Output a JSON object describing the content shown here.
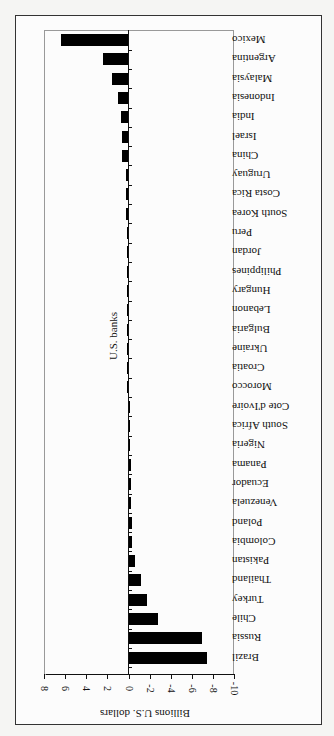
{
  "chart_data": {
    "type": "bar",
    "orientation": "horizontal, page rotated 90 degrees",
    "title": "",
    "xlabel": "Billions U.S. dollars",
    "ylabel": "",
    "series_label": "U.S. banks",
    "xlim": [
      -10,
      8
    ],
    "x_ticks": [
      "8",
      "6",
      "4",
      "2",
      "0",
      "-2",
      "-4",
      "-6",
      "-8",
      "-10"
    ],
    "grid": false,
    "categories": [
      "Mexico",
      "Argentina",
      "Malaysia",
      "Indonesia",
      "India",
      "Israel",
      "China",
      "Uruguay",
      "Costa Rica",
      "South Korea",
      "Peru",
      "Jordan",
      "Philippines",
      "Hungary",
      "Lebanon",
      "Bulgaria",
      "Ukraine",
      "Croatia",
      "Morocco",
      "Cote d'Ivoire",
      "South Africa",
      "Nigeria",
      "Panama",
      "Ecuador",
      "Venezuela",
      "Poland",
      "Colombia",
      "Pakistan",
      "Thailand",
      "Turkey",
      "Chile",
      "Russia",
      "Brazil"
    ],
    "values": [
      6.4,
      2.4,
      1.6,
      1.0,
      0.7,
      0.6,
      0.6,
      0.2,
      0.2,
      0.2,
      0.1,
      0.0,
      0.0,
      0.0,
      0.0,
      0.0,
      0.0,
      0.0,
      0.0,
      -0.1,
      -0.1,
      -0.1,
      -0.2,
      -0.2,
      -0.2,
      -0.3,
      -0.3,
      -0.6,
      -1.2,
      -1.8,
      -2.8,
      -7.0,
      -7.4
    ],
    "series": [
      {
        "name": "U.S. banks",
        "values": [
          6.4,
          2.4,
          1.6,
          1.0,
          0.7,
          0.6,
          0.6,
          0.2,
          0.2,
          0.2,
          0.1,
          0.0,
          0.0,
          0.0,
          0.0,
          0.0,
          0.0,
          0.0,
          0.0,
          -0.1,
          -0.1,
          -0.1,
          -0.2,
          -0.2,
          -0.2,
          -0.3,
          -0.3,
          -0.6,
          -1.2,
          -1.8,
          -2.8,
          -7.0,
          -7.4
        ]
      }
    ]
  }
}
